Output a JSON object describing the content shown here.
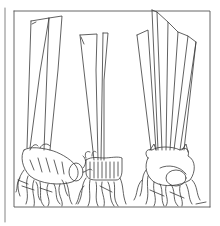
{
  "image": {
    "kind": "botanical line drawing",
    "description": "Three bulbs with trimmed flat leaf blades and roots, black ink on white, inside a rectangular frame",
    "subjects": [
      {
        "name": "left-bulb",
        "leaf_count": 2
      },
      {
        "name": "middle-bulb",
        "leaf_count": 3
      },
      {
        "name": "right-bulb",
        "leaf_count": 5
      }
    ],
    "colors": {
      "ink": "#3a3a3a",
      "paper": "#ffffff",
      "frame": "#555555"
    }
  }
}
